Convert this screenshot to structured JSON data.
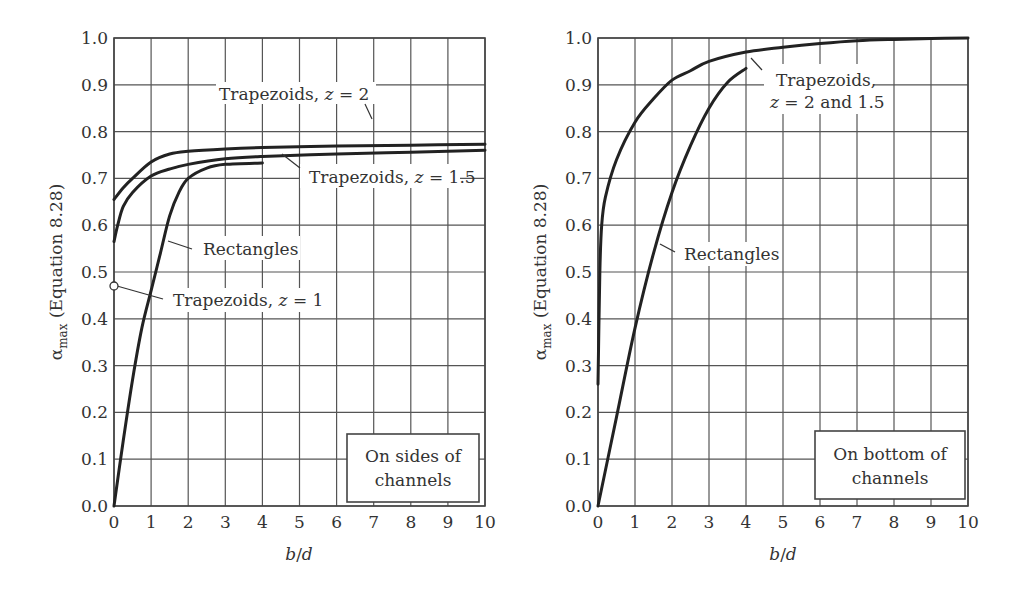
{
  "chart_data": [
    {
      "type": "line",
      "panel": "left",
      "title": "",
      "xlabel": "b/d",
      "ylabel": "α_max (Equation 8.28)",
      "xlim": [
        0,
        10
      ],
      "ylim": [
        0.0,
        1.0
      ],
      "x_ticks": [
        "0",
        "1",
        "2",
        "3",
        "4",
        "5",
        "6",
        "7",
        "8",
        "9",
        "10"
      ],
      "y_ticks": [
        "0.0",
        "0.1",
        "0.2",
        "0.3",
        "0.4",
        "0.5",
        "0.6",
        "0.7",
        "0.8",
        "0.9",
        "1.0"
      ],
      "grid": true,
      "box_label": [
        "On sides of",
        "channels"
      ],
      "series": [
        {
          "name": "Trapezoids, z = 2",
          "x": [
            0,
            0.25,
            0.5,
            1,
            1.5,
            2,
            3,
            4,
            6,
            8,
            10
          ],
          "y": [
            0.655,
            0.68,
            0.7,
            0.735,
            0.752,
            0.758,
            0.763,
            0.766,
            0.769,
            0.771,
            0.773
          ]
        },
        {
          "name": "Trapezoids, z = 1.5",
          "x": [
            0,
            0.1,
            0.25,
            0.5,
            1,
            1.5,
            2,
            3,
            4,
            6,
            8,
            10
          ],
          "y": [
            0.565,
            0.6,
            0.64,
            0.67,
            0.705,
            0.72,
            0.73,
            0.742,
            0.747,
            0.752,
            0.756,
            0.76
          ]
        },
        {
          "name": "Rectangles",
          "x": [
            0,
            0.25,
            0.5,
            0.75,
            1,
            1.25,
            1.5,
            1.75,
            2,
            2.5,
            3,
            4
          ],
          "y": [
            0.0,
            0.14,
            0.27,
            0.38,
            0.46,
            0.54,
            0.62,
            0.67,
            0.7,
            0.722,
            0.73,
            0.733
          ]
        },
        {
          "name": "Trapezoids, z = 1",
          "x": [
            0
          ],
          "y": [
            0.475
          ]
        }
      ],
      "annotations": [
        "Trapezoids, z = 2",
        "Trapezoids, z = 1.5",
        "Rectangles",
        "Trapezoids, z = 1"
      ]
    },
    {
      "type": "line",
      "panel": "right",
      "title": "",
      "xlabel": "b/d",
      "ylabel": "α_max (Equation 8.28)",
      "xlim": [
        0,
        10
      ],
      "ylim": [
        0.0,
        1.0
      ],
      "x_ticks": [
        "0",
        "1",
        "2",
        "3",
        "4",
        "5",
        "6",
        "7",
        "8",
        "9",
        "10"
      ],
      "y_ticks": [
        "0.0",
        "0.1",
        "0.2",
        "0.3",
        "0.4",
        "0.5",
        "0.6",
        "0.7",
        "0.8",
        "0.9",
        "1.0"
      ],
      "grid": true,
      "box_label": [
        "On bottom of",
        "channels"
      ],
      "series": [
        {
          "name": "Trapezoids, z = 2 and 1.5",
          "x": [
            0,
            0.05,
            0.1,
            0.2,
            0.5,
            1,
            1.5,
            2,
            2.5,
            3,
            4,
            5,
            6,
            7,
            8,
            9,
            10
          ],
          "y": [
            0.26,
            0.5,
            0.6,
            0.66,
            0.74,
            0.82,
            0.87,
            0.91,
            0.93,
            0.95,
            0.97,
            0.98,
            0.988,
            0.994,
            0.997,
            0.999,
            1.0
          ]
        },
        {
          "name": "Rectangles",
          "x": [
            0,
            0.5,
            1,
            1.5,
            2,
            2.5,
            3,
            3.5,
            4
          ],
          "y": [
            0.0,
            0.19,
            0.38,
            0.54,
            0.67,
            0.77,
            0.85,
            0.905,
            0.935
          ]
        }
      ],
      "annotations": [
        "Trapezoids,",
        "z = 2 and 1.5",
        "Rectangles"
      ]
    }
  ],
  "labels": {
    "left": {
      "z2": "Trapezoids, ",
      "z2_var": "z",
      "z2_eq": " = 2",
      "z15": "Trapezoids, ",
      "z15_var": "z",
      "z15_eq": " = 1.5",
      "rect": "Rectangles",
      "z1": "Trapezoids, ",
      "z1_var": "z",
      "z1_eq": " = 1",
      "box1": "On sides of",
      "box2": "channels",
      "xlabel_b": "b",
      "xlabel_slash": "/",
      "xlabel_d": "d",
      "ylabel_alpha": "α",
      "ylabel_sub": "max",
      "ylabel_rest": " (Equation 8.28)"
    },
    "right": {
      "trap1": "Trapezoids,",
      "trap2_var": "z",
      "trap2_rest": " = 2 and 1.5",
      "rect": "Rectangles",
      "box1": "On bottom of",
      "box2": "channels",
      "xlabel_b": "b",
      "xlabel_slash": "/",
      "xlabel_d": "d",
      "ylabel_alpha": "α",
      "ylabel_sub": "max",
      "ylabel_rest": " (Equation 8.28)"
    }
  }
}
